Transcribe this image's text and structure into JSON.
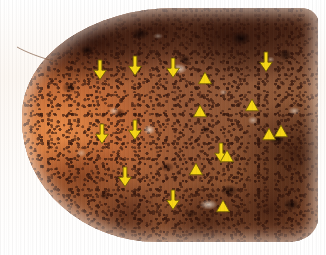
{
  "figure": {
    "kind": "annotated-photomicrograph",
    "background_color": "#fdf8f3",
    "marker_color": "#f5d416",
    "marker_stroke": "#6e5a06",
    "tissue_colors": {
      "rim_orange": "#e98f4c",
      "body_brown": "#8a5536",
      "dark_pigment": "#3a1a12",
      "keratin_pale": "#ece0d0"
    }
  },
  "annotations": {
    "legend_note": "",
    "arrow_count": 9,
    "arrowhead_count": 9,
    "arrows": [
      {
        "name": "arrow-1",
        "x": 93,
        "y": 60,
        "label": ""
      },
      {
        "name": "arrow-2",
        "x": 128,
        "y": 56,
        "label": ""
      },
      {
        "name": "arrow-3",
        "x": 166,
        "y": 58,
        "label": ""
      },
      {
        "name": "arrow-4",
        "x": 259,
        "y": 52,
        "label": ""
      },
      {
        "name": "arrow-5",
        "x": 95,
        "y": 124,
        "label": ""
      },
      {
        "name": "arrow-6",
        "x": 128,
        "y": 120,
        "label": ""
      },
      {
        "name": "arrow-7",
        "x": 118,
        "y": 167,
        "label": ""
      },
      {
        "name": "arrow-8",
        "x": 214,
        "y": 143,
        "label": ""
      },
      {
        "name": "arrow-9",
        "x": 166,
        "y": 190,
        "label": ""
      }
    ],
    "arrowheads": [
      {
        "name": "arrowhead-1",
        "x": 198,
        "y": 72,
        "label": ""
      },
      {
        "name": "arrowhead-2",
        "x": 245,
        "y": 99,
        "label": ""
      },
      {
        "name": "arrowhead-3",
        "x": 193,
        "y": 105,
        "label": ""
      },
      {
        "name": "arrowhead-4",
        "x": 262,
        "y": 128,
        "label": ""
      },
      {
        "name": "arrowhead-5",
        "x": 274,
        "y": 125,
        "label": ""
      },
      {
        "name": "arrowhead-6",
        "x": 220,
        "y": 150,
        "label": ""
      },
      {
        "name": "arrowhead-7",
        "x": 189,
        "y": 163,
        "label": ""
      },
      {
        "name": "arrowhead-8",
        "x": 216,
        "y": 200,
        "label": ""
      }
    ]
  }
}
